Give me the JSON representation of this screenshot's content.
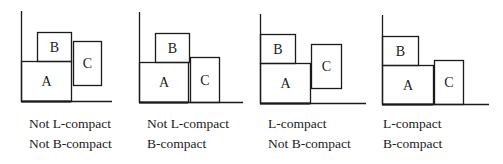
{
  "panels": [
    {
      "id": "panel-1",
      "left": 0,
      "axes": {
        "x0": 21,
        "y_top": 11,
        "y_base": 101,
        "x_end": 112
      },
      "boxes": [
        {
          "label": "A",
          "x": 21,
          "y": 61,
          "w": 50,
          "h": 40
        },
        {
          "label": "B",
          "x": 37,
          "y": 32,
          "w": 34,
          "h": 29
        },
        {
          "label": "C",
          "x": 73,
          "y": 41,
          "w": 28,
          "h": 44
        }
      ],
      "caption": {
        "x": 29,
        "line1": "Not L-compact",
        "line2": "Not B-compact"
      }
    },
    {
      "id": "panel-2",
      "left": 0,
      "axes": {
        "x0": 139,
        "y_top": 12,
        "y_base": 102,
        "x_end": 243
      },
      "boxes": [
        {
          "label": "A",
          "x": 139,
          "y": 62,
          "w": 49,
          "h": 40
        },
        {
          "label": "B",
          "x": 155,
          "y": 33,
          "w": 34,
          "h": 29
        },
        {
          "label": "C",
          "x": 190,
          "y": 57,
          "w": 29,
          "h": 45
        }
      ],
      "caption": {
        "x": 147,
        "line1": "Not L-compact",
        "line2": "B-compact"
      }
    },
    {
      "id": "panel-3",
      "left": 0,
      "axes": {
        "x0": 260,
        "y_top": 14,
        "y_base": 103,
        "x_end": 366
      },
      "boxes": [
        {
          "label": "A",
          "x": 260,
          "y": 63,
          "w": 50,
          "h": 40
        },
        {
          "label": "B",
          "x": 260,
          "y": 34,
          "w": 35,
          "h": 29
        },
        {
          "label": "C",
          "x": 311,
          "y": 44,
          "w": 30,
          "h": 44
        }
      ],
      "caption": {
        "x": 268,
        "line1": "L-compact",
        "line2": "Not B-compact"
      }
    },
    {
      "id": "panel-4",
      "left": 0,
      "axes": {
        "x0": 382,
        "y_top": 15,
        "y_base": 104,
        "x_end": 489
      },
      "boxes": [
        {
          "label": "A",
          "x": 382,
          "y": 65,
          "w": 51,
          "h": 39
        },
        {
          "label": "B",
          "x": 382,
          "y": 36,
          "w": 36,
          "h": 29
        },
        {
          "label": "C",
          "x": 434,
          "y": 60,
          "w": 29,
          "h": 44
        }
      ],
      "caption": {
        "x": 383,
        "line1": "L-compact",
        "line2": "B-compact"
      }
    }
  ],
  "colors": {
    "stroke": "#1a1a1a",
    "background": "#ffffff"
  }
}
